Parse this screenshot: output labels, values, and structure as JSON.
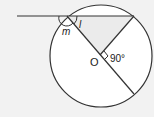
{
  "diagram": {
    "type": "circle-geometry",
    "labels": {
      "angle_m": "m",
      "angle_l": "l",
      "center": "O",
      "right_angle": "90°"
    },
    "colors": {
      "background": "#f2f2f2",
      "circle_fill": "#ffffff",
      "shaded": "#ebebeb",
      "stroke": "#333333"
    }
  }
}
